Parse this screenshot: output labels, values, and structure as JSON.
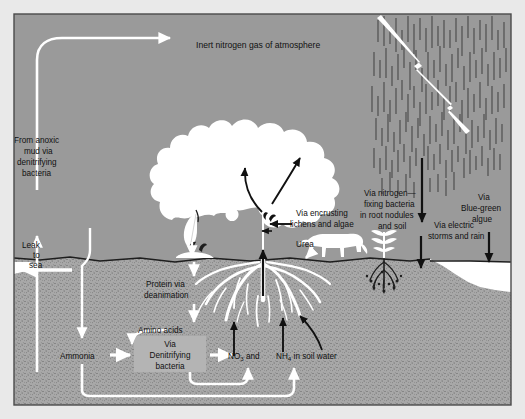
{
  "figure": {
    "colors": {
      "sky": "#9a9a9a",
      "soil": "#a8a8a8",
      "soil_speckle": "#5d5d5d",
      "water": "#ffffff",
      "white_arrow": "#ffffff",
      "black_arrow": "#111111",
      "box_fill": "#b4b4b4",
      "tree": "#ffffff",
      "outer_margin": "#e9e9e9",
      "border": "#4a4a4a"
    }
  },
  "labels": {
    "atmosphere": "Inert nitrogen  gas of atmosphere",
    "from_anoxic_mud": {
      "line1": "From anoxic",
      "line2": "mud via",
      "line3": "denitrifying",
      "line4": "bacteria"
    },
    "leak_to_sea": {
      "line1": "Leak",
      "line2": "to",
      "line3": "sea"
    },
    "electric_storms": {
      "line1": "Via electric",
      "line2": "storms and rain"
    },
    "nitrogen_fixing": {
      "line1": "Via nitrogen—",
      "line2": "fixing bacteria",
      "line3": "in root nodules",
      "line4": "and soil"
    },
    "blue_green_algae": {
      "line1": "Via",
      "line2": "Blue-green",
      "line3": "algue"
    },
    "encrusting_lichens": {
      "line1": "Via encrusting",
      "line2": "lichens and algae"
    },
    "urea": "Urea",
    "protein_deanimation": {
      "line1": "Protein via",
      "line2": "deanimation"
    },
    "amino_acids": "Amino acids",
    "ammonia": "Ammonia",
    "denitrifying_box": {
      "line1": "Via",
      "line2": "Denitrifying",
      "line3": "bacteria"
    },
    "soil_water": {
      "nitrate": "NO",
      "nitrate_sub": "3",
      "and": " and",
      "ammonium": "NH",
      "ammonium_sub": "4",
      "tail": " in soil water"
    }
  },
  "icons": {
    "tree": "tree-icon",
    "cow": "cow-icon",
    "leaf": "falling-leaf-icon",
    "litter": "leaf-litter-icon",
    "lightning": "lightning-bolt-icon",
    "rain": "rain-streaks-icon",
    "legume": "legume-plant-icon",
    "nodules": "root-nodules-icon",
    "roots": "tree-roots-icon",
    "sea_left": "sea-left-icon",
    "sea_right": "sea-right-icon"
  }
}
